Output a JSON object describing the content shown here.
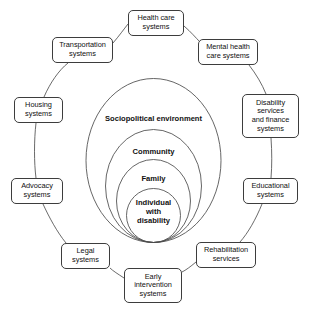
{
  "diagram": {
    "type": "concentric-ecological-model",
    "stroke_color": "#3d3d3d",
    "background_color": "#ffffff",
    "environment_rings": [
      {
        "id": "sociopolitical",
        "label": "Sociopolitical environment",
        "level": 1,
        "cx": 153.5,
        "cy": 160.5,
        "rx": 67.5,
        "ry": 82,
        "label_x": 153.5,
        "label_y": 115
      },
      {
        "id": "community",
        "label": "Community",
        "level": 2,
        "cx": 153.5,
        "cy": 186,
        "rx": 48,
        "ry": 56.5,
        "label_x": 153.5,
        "label_y": 148
      },
      {
        "id": "family",
        "label": "Family",
        "level": 3,
        "cx": 153.5,
        "cy": 201,
        "rx": 37,
        "ry": 41.5,
        "label_x": 153.5,
        "label_y": 175
      },
      {
        "id": "individual",
        "label": "Individual\nwith\ndisability",
        "level": 4,
        "cx": 153.5,
        "cy": 215.5,
        "rx": 27,
        "ry": 27,
        "label_x": 153.5,
        "label_y": 199
      }
    ],
    "system_nodes": [
      {
        "id": "health-care-systems",
        "label": "Health care\nsystems",
        "x": 128,
        "y": 10,
        "w": 56,
        "h": 26
      },
      {
        "id": "mental-health-care-systems",
        "label": "Mental health\ncare systems",
        "x": 198,
        "y": 39,
        "w": 60,
        "h": 26
      },
      {
        "id": "disability-services-and-finance-systems",
        "label": "Disability\nservices\nand finance\nsystems",
        "x": 242,
        "y": 94,
        "w": 57,
        "h": 44
      },
      {
        "id": "educational-systems",
        "label": "Educational\nsystems",
        "x": 243,
        "y": 178,
        "w": 55,
        "h": 26
      },
      {
        "id": "rehabilitation-services",
        "label": "Rehabilitation\nservices",
        "x": 196,
        "y": 242,
        "w": 60,
        "h": 26
      },
      {
        "id": "early-intervention-systems",
        "label": "Early\nintervention\nsystems",
        "x": 124,
        "y": 268,
        "w": 58,
        "h": 35
      },
      {
        "id": "legal-systems",
        "label": "Legal\nsystems",
        "x": 61,
        "y": 243,
        "w": 49,
        "h": 26
      },
      {
        "id": "advocacy-systems",
        "label": "Advocacy\nsystems",
        "x": 11,
        "y": 178,
        "w": 52,
        "h": 26
      },
      {
        "id": "housing-systems",
        "label": "Housing\nsystems",
        "x": 14,
        "y": 97,
        "w": 49,
        "h": 26
      },
      {
        "id": "transportation-systems",
        "label": "Transportation\nsystems",
        "x": 52,
        "y": 37,
        "w": 61,
        "h": 26
      }
    ],
    "connector_arcs": [
      {
        "id": "transportation-to-health-care",
        "from": "transportation-systems",
        "to": "health-care-systems",
        "d": "M 113 43 C 119 36 124 29 128 24"
      },
      {
        "id": "health-care-to-mental-health",
        "from": "health-care-systems",
        "to": "mental-health-care-systems",
        "d": "M 184 26 C 191 32 196 38 200 42"
      },
      {
        "id": "mental-health-to-disability-services",
        "from": "mental-health-care-systems",
        "to": "disability-services-and-finance-systems",
        "d": "M 249 65 C 256 74 262 84 266 94"
      },
      {
        "id": "disability-services-to-educational",
        "from": "disability-services-and-finance-systems",
        "to": "educational-systems",
        "d": "M 271 138 C 272 152 272 166 271 178"
      },
      {
        "id": "educational-to-rehabilitation",
        "from": "educational-systems",
        "to": "rehabilitation-services",
        "d": "M 262 204 C 256 219 248 233 240 242"
      },
      {
        "id": "rehabilitation-to-early-intervention",
        "from": "rehabilitation-services",
        "to": "early-intervention-systems",
        "d": "M 196 262 C 190 267 186 270 182 272"
      },
      {
        "id": "early-intervention-to-legal",
        "from": "early-intervention-systems",
        "to": "legal-systems",
        "d": "M 124 278 C 118 274 113 271 110 268"
      },
      {
        "id": "legal-to-advocacy",
        "from": "legal-systems",
        "to": "advocacy-systems",
        "d": "M 66 243 C 57 232 49 217 43 204"
      },
      {
        "id": "advocacy-to-housing",
        "from": "advocacy-systems",
        "to": "housing-systems",
        "d": "M 36 178 C 34 163 34 140 36 123"
      },
      {
        "id": "housing-to-transportation",
        "from": "housing-systems",
        "to": "transportation-systems",
        "d": "M 44 97 C 50 83 59 70 68 63"
      }
    ]
  }
}
